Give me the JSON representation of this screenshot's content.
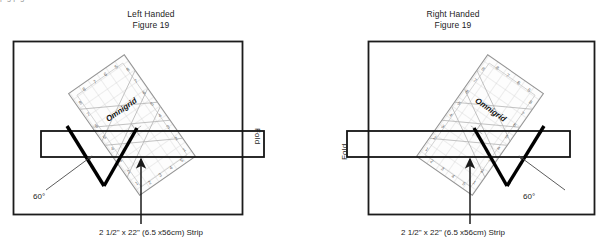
{
  "document": {
    "figure_number": "Figure 19",
    "top_cropped_text": "p      g        p        g"
  },
  "panels": [
    {
      "id": "left-handed",
      "handedness_label": "Left Handed",
      "figure_label": "Figure 19",
      "fold_label": "Fold",
      "angle_label": "60°",
      "strip_caption": "2 1/2\" x 22\" (6.5 x56cm) Strip",
      "ruler_brand": "Omnigrid",
      "ruler_rotation_deg": -35,
      "fold_side": "right"
    },
    {
      "id": "right-handed",
      "handedness_label": "Right Handed",
      "figure_label": "Figure 19",
      "fold_label": "Fold",
      "angle_label": "60°",
      "strip_caption": "2 1/2\" x 22\" (6.5 x56cm) Strip",
      "ruler_brand": "Omnigrid",
      "ruler_rotation_deg": 35,
      "fold_side": "left"
    }
  ],
  "ruler_tick_numbers": [
    "8",
    "7",
    "6",
    "5",
    "4",
    "3",
    "2",
    "1"
  ],
  "colors": {
    "ink": "#1a1a1a",
    "border": "#1c1c1c",
    "ruler_grid": "#b9b9b9",
    "ruler_fill": "#fdfdfd",
    "cut_line": "#000000",
    "leader": "#555555",
    "page_background": "#ffffff"
  },
  "geometry": {
    "box": {
      "x": 13,
      "y": 41,
      "width": 230,
      "height": 174
    },
    "strip": {
      "x": 41,
      "y": 131,
      "width": 223,
      "height": 26
    }
  }
}
